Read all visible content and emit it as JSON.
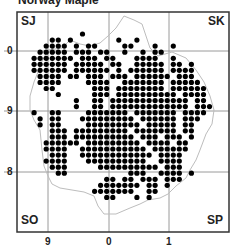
{
  "title": "Norway Maple",
  "map": {
    "frame": {
      "x": 17,
      "y": 12,
      "w": 212,
      "h": 220
    },
    "gridlines_x": [
      48,
      109,
      169
    ],
    "gridlines_y": [
      51,
      111,
      172
    ],
    "colors": {
      "frame": "#333333",
      "grid": "#9a9a9a",
      "boundary": "#bdbdbd",
      "dot": "#000000"
    },
    "corner_labels": {
      "top_left": "SJ",
      "top_right": "SK",
      "bottom_left": "SO",
      "bottom_right": "SP"
    },
    "y_axis_labels": [
      {
        "label": "0",
        "y": 51
      },
      {
        "label": "9",
        "y": 111
      },
      {
        "label": "8",
        "y": 172
      }
    ],
    "x_axis_labels": [
      {
        "label": "9",
        "x": 48
      },
      {
        "label": "0",
        "x": 109
      },
      {
        "label": "1",
        "x": 169
      }
    ],
    "dot_grid": {
      "origin_x": 22,
      "origin_y": 28,
      "step": 6.05,
      "radius": 2.6
    },
    "rows": [
      "...................",
      "..........*....................",
      ".....**.*.......*..*...........",
      "....****.*.**....**...*..*.....",
      "...*****.***.**..*..*.**.......",
      "..*******.***.**...****..*.....",
      "..******.*****.**..*****.**.*..",
      "..******.******.*.******.****..",
      "...****.**.***.***.******.***..",
      "...****....****..*******.*****.",
      "....**......***.********.******",
      "......*.....***.**********.****",
      ".........*..**.*************.**",
      ".........*..**.*************.***",
      "..*..**....*******.*******.****",
      "...*.**...*********.******.***.",
      "...*.**....*********.*****.**..",
      ".....***.*********.*******.**..",
      ".....***.**********.***.***.*..",
      "....******.*********.****.**...",
      "....****..***********.******...",
      ".....***..************.****....",
      "....****...**********..****....",
      ".....***.....**********.***....",
      "......**..........***..****.*..",
      "..............**.**.***.***....",
      ".............*******.**.*......",
      "............*******..**........",
      "..............**...*.*........."
    ]
  }
}
